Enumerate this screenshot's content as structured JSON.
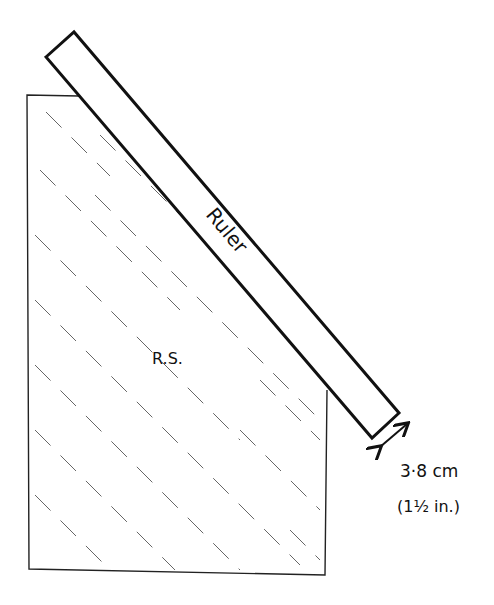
{
  "diagram": {
    "labels": {
      "ruler": "Ruler",
      "region": "R.S.",
      "width_metric": "3·8 cm",
      "width_imperial": "(1½ in.)"
    },
    "colors": {
      "stroke": "#111111",
      "hatch": "#555555",
      "background": "#ffffff"
    }
  }
}
